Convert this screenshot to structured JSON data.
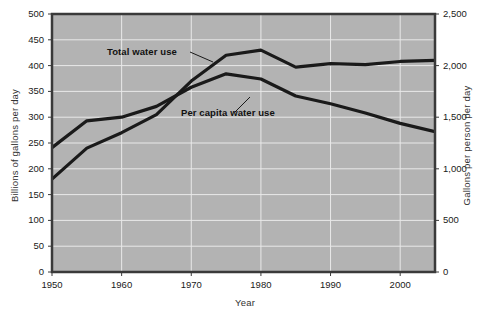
{
  "chart_data": {
    "type": "line",
    "title": "",
    "xlabel": "Year",
    "ylabel": "Billions of gallons per day",
    "ylabel_right": "Gallons per person per day",
    "grid": true,
    "legend_position": "inline-annotation",
    "plot_background": "#b3b3b3",
    "line_color": "#1a1a1a",
    "x": [
      1950,
      1955,
      1960,
      1965,
      1970,
      1975,
      1980,
      1985,
      1990,
      1995,
      2000,
      2005
    ],
    "xlim": [
      1950,
      2005
    ],
    "ylim": [
      0,
      500
    ],
    "ylim_right": [
      0,
      2500
    ],
    "xticks": [
      1950,
      1960,
      1970,
      1980,
      1990,
      2000
    ],
    "xtick_labels": [
      "1950",
      "1960",
      "1970",
      "1980",
      "1990",
      "2000"
    ],
    "yticks_left": [
      0,
      50,
      100,
      150,
      200,
      250,
      300,
      350,
      400,
      450,
      500
    ],
    "ytick_labels_left": [
      "0",
      "50",
      "100",
      "150",
      "200",
      "250",
      "300",
      "350",
      "400",
      "450",
      "500"
    ],
    "yticks_right": [
      0,
      500,
      1000,
      1500,
      2000,
      2500
    ],
    "ytick_labels_right": [
      "0",
      "500",
      "1,000",
      "1,500",
      "2,000",
      "2,500"
    ],
    "series": [
      {
        "name": "Total water use",
        "axis": "left",
        "units": "Billions of gallons per day",
        "label": "Total water use",
        "values": [
          180,
          240,
          270,
          305,
          370,
          420,
          430,
          397,
          404,
          402,
          408,
          410
        ]
      },
      {
        "name": "Per capita water use",
        "axis": "right",
        "units": "Gallons per person per day",
        "label": "Per capita water use",
        "values": [
          1205,
          1465,
          1500,
          1605,
          1790,
          1920,
          1870,
          1705,
          1630,
          1540,
          1440,
          1360
        ]
      }
    ],
    "annotations": [
      {
        "text": "Total water use",
        "target_x": 1973,
        "target_y_left": 400
      },
      {
        "text": "Per capita water use",
        "target_x": 1981,
        "target_y_right": 1870
      }
    ]
  },
  "axes": {
    "left_title": "Billions of gallons per day",
    "right_title": "Gallons per person per day",
    "bottom_title": "Year"
  }
}
